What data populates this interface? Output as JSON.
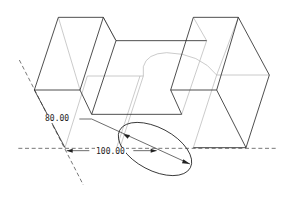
{
  "dimensions": {
    "diameter": "80.00",
    "distance": "100.00"
  },
  "colors": {
    "edge": "#222222",
    "hidden": "#aaaaaa"
  }
}
